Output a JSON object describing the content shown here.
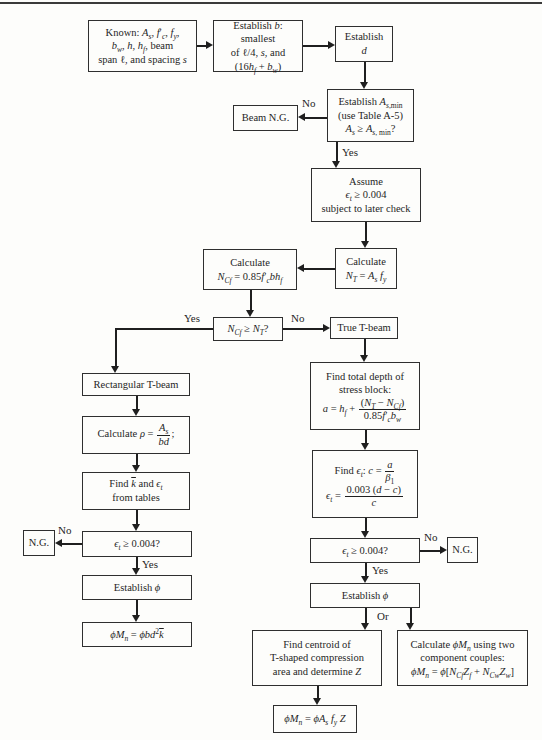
{
  "page": {
    "background": "#fdfdfb",
    "ink": "#1f1f1f",
    "border": "#2f2f2f"
  },
  "edge_labels": {
    "yes": "Yes",
    "no": "No",
    "or": "Or"
  },
  "nodes": {
    "known": {
      "html": "Known: <i>A<sub>s</sub></i>, <i>f</i>&#8242;<i><sub>c</sub></i>, <i>f<sub>y</sub></i>,<br><i>b<sub>w</sub></i>, <i>h</i>, <i>h<sub>f</sub></i>, beam<br>span &#8467;, and spacing <i>s</i>"
    },
    "establish_b": {
      "html": "Establish <i>b</i>: smallest<br>of &#8467;/4, <i>s</i>, and<br>(16<i>h<sub>f</sub></i> + <i>b<sub>w</sub></i>)"
    },
    "establish_d": {
      "html": "Establish<br><i>d</i>"
    },
    "establish_as_min": {
      "html": "Establish <i>A</i><sub><i>s</i>,min</sub><br>(use Table A-5)<br><i>A<sub>s</sub></i> &#8805; <i>A</i><sub><i>s</i>, min</sub>?"
    },
    "beam_ng": {
      "html": "Beam N.G."
    },
    "assume_strain": {
      "html": "Assume<br><i>&#1013;<sub>t</sub></i> &#8805; 0.004<br>subject to later check"
    },
    "calc_nt": {
      "html": "Calculate<br><i>N<sub>T</sub></i> = <i>A<sub>s</sub> f<sub>y</sub></i>"
    },
    "calc_ncf": {
      "html": "Calculate<br><i>N<sub>Cf</sub></i> = 0.85<i>f</i>&#8242;<i><sub>c</sub>bh<sub>f</sub></i>"
    },
    "ncf_ge_nt": {
      "html": "<i>N<sub>Cf</sub></i> &#8805; <i>N<sub>T</sub></i>?"
    },
    "true_t_beam": {
      "html": "True T-beam"
    },
    "find_stress_block_depth": {
      "html": "Find total depth of<br>stress block:<br><i>a</i> = <i>h<sub>f</sub></i> + <span class='frac'><span class='num'>(<i>N<sub>T</sub></i> &#8722; <i>N<sub>Cf</sub></i>)</span><span class='den'>0.85<i>f</i>&#8242;<i><sub>c</sub>b<sub>w</sub></i></span></span>"
    },
    "rectangular_t_beam": {
      "html": "Rectangular T-beam"
    },
    "calc_rho": {
      "html": "Calculate <i>&#961;</i> = <span class='frac'><span class='num'><i>A<sub>s</sub></i></span><span class='den'><i>bd</i></span></span>;"
    },
    "find_kbar": {
      "html": "Find <i class='ovl'>k</i> and <i>&#1013;<sub>t</sub></i><br>from tables"
    },
    "strain_check_left": {
      "html": "<i>&#1013;<sub>t</sub></i> &#8805; 0.004?"
    },
    "ng_left": {
      "html": "N.G."
    },
    "establish_phi_left": {
      "html": "Establish <i>&#981;</i>"
    },
    "phi_mn_rect": {
      "html": "<i>&#981;M<sub>n</sub></i> = <i>&#981;bd</i><sup>2</sup><i class='ovl'>k</i>"
    },
    "find_strain_c": {
      "html": "Find <i>&#1013;<sub>t</sub></i>: <i>c</i> = <span class='frac'><span class='num'><i>a</i></span><span class='den'><i>&#946;</i><sub>1</sub></span></span><br><i>&#1013;<sub>t</sub></i> = <span class='frac'><span class='num'>0.003 (<i>d</i> &#8722; <i>c</i>)</span><span class='den'><i>c</i></span></span>"
    },
    "strain_check_right": {
      "html": "<i>&#1013;<sub>t</sub></i> &#8805; 0.004?"
    },
    "ng_right": {
      "html": "N.G."
    },
    "establish_phi_right": {
      "html": "Establish <i>&#981;</i>"
    },
    "find_centroid_z": {
      "html": "Find centroid of<br>T-shaped compression<br>area and determine <i>Z</i>"
    },
    "calc_component_couples": {
      "html": "Calculate <i>&#981;M<sub>n</sub></i> using two<br>component couples:<br><i>&#981;M<sub>n</sub></i> = <i>&#981;</i>[<i>N<sub>Cf</sub>Z<sub>f</sub></i> + <i>N<sub>Cw</sub>Z<sub>w</sub></i>]"
    },
    "phi_mn_final": {
      "html": "<i>&#981;M<sub>n</sub></i> = <i>&#981;A<sub>s</sub> f<sub>y</sub> Z</i>"
    }
  }
}
